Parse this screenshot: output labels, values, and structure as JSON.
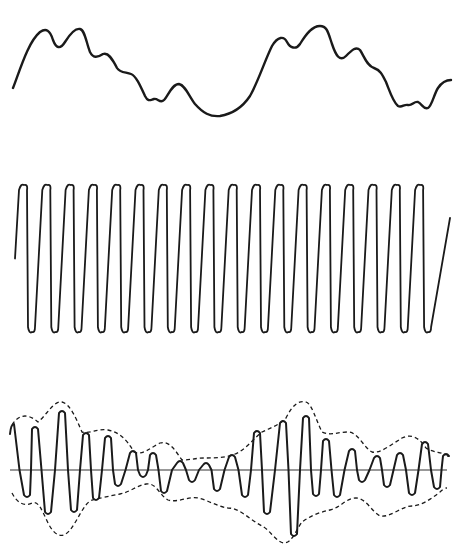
{
  "diagram": {
    "colors": {
      "ink": "#1a1a1a",
      "axis": "#333333",
      "background": "#ffffff"
    },
    "panels": [
      {
        "id": "modulating-signal",
        "label": "",
        "stroke_width": 2.4,
        "path": "M13,88 C20,70 28,42 40,32 C46,28 50,30 53,40 C56,48 60,50 65,42 C70,34 75,28 80,29 C85,30 86,42 90,52 C93,58 97,58 103,54 C108,52 112,58 117,68 C120,73 126,72 131,74 C136,76 140,85 145,96 C148,102 150,100 154,99 C158,98 160,104 164,100 C168,96 172,84 179,84 C185,85 189,96 195,104 C203,113 210,117 220,116 C232,114 242,108 250,96 C258,82 265,60 272,46 C278,36 284,36 287,42 C290,48 296,50 300,44 C306,34 312,26 320,26 C327,26 328,32 332,44 C336,56 340,62 346,56 C352,50 356,46 360,50 C364,56 367,66 374,68 C380,70 382,74 386,82 C390,92 393,102 398,106 C402,108 404,104 408,105 C412,106 414,101 418,102 C422,104 424,110 428,108 C432,106 434,94 438,88 C442,82 446,80 451,80"
      },
      {
        "id": "carrier-wave",
        "label": "",
        "stroke_width": 1.8,
        "cycles": 18,
        "x_start": 15,
        "x_end": 450,
        "y_top": 185,
        "y_bottom": 332,
        "first_loop_x": 22,
        "loop_spacing": 23.3
      },
      {
        "id": "modulated-wave",
        "label": "",
        "stroke_width": 2.0,
        "axis": {
          "x1": 10,
          "x2": 447,
          "y": 470
        },
        "upper_envelope": "M12,425 C20,412 30,415 38,422 C46,416 54,400 62,402 C70,404 76,418 82,432 C90,434 98,428 108,430 C118,432 126,438 134,452 C142,456 150,448 160,443 C170,440 176,452 182,460 C190,460 196,458 205,458 C214,458 224,458 232,455 C244,452 252,440 262,432 C270,428 278,426 286,418 C292,406 298,400 306,402 C312,404 316,420 322,432 C330,436 338,432 348,432 C358,432 364,448 372,452 C380,454 392,444 402,438 C410,434 418,436 426,448 C432,452 440,452 447,455",
        "lower_envelope": "M12,493 C18,505 26,506 32,503 C38,500 42,510 48,523 C54,535 62,540 70,530 C78,520 84,503 92,500 C100,498 110,496 120,494 C130,492 136,486 146,484 C156,482 160,496 168,500 C178,503 188,496 198,498 C208,500 218,507 228,508 C240,508 250,520 262,526 C270,530 276,542 284,543 C292,543 296,530 302,522 C310,516 320,512 330,510 C340,508 346,498 356,498 C366,498 372,512 380,516 C390,518 402,506 412,506 C420,506 430,500 440,492 C444,488 446,488 447,488",
        "carrier_cycles": 20
      }
    ]
  }
}
